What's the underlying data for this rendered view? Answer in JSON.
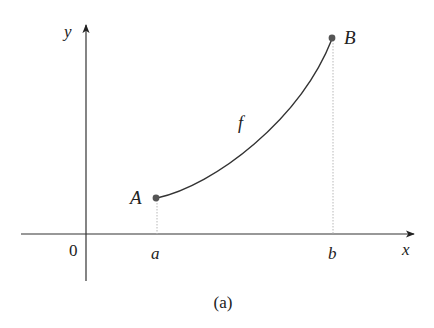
{
  "diagram": {
    "caption": "(a)",
    "axes": {
      "x_label": "x",
      "y_label": "y",
      "origin_label": "0"
    },
    "curve": {
      "label": "f",
      "start_point_label": "A",
      "end_point_label": "B"
    },
    "ticks": {
      "a_label": "a",
      "b_label": "b"
    },
    "colors": {
      "axis": "#333333",
      "curve": "#333333",
      "point": "#555555",
      "dashed": "#b8b8b8"
    }
  }
}
